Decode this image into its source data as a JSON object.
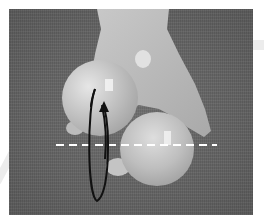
{
  "figure": {
    "colors": {
      "background": "#606060",
      "hand": "#bdbdbd",
      "ball": "#c8c8c8",
      "annotation_line": "#ffffff",
      "rotation_arrow": "#111111",
      "border": "#ffffff"
    },
    "annotations": {
      "dashed_axis": {
        "orientation": "horizontal",
        "style": "dashed",
        "color": "#ffffff"
      },
      "rotation_arrow": {
        "shape": "ellipse",
        "direction": "up",
        "color": "#111111"
      }
    }
  }
}
